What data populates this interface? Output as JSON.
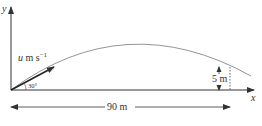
{
  "diagram": {
    "axes": {
      "y_label": "y",
      "x_label": "x"
    },
    "velocity": {
      "symbol": "u",
      "unit": " m s",
      "exponent": "−1"
    },
    "angle_label": "30°",
    "height_label": "5 m",
    "distance_label": "90 m",
    "colors": {
      "ink": "#333333",
      "curve": "#888888"
    }
  }
}
